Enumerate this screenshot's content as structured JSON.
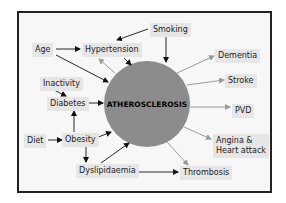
{
  "diagram": {
    "center": {
      "label": "ATHEROSCLEROSIS",
      "color": "#8c8c8c"
    },
    "frame_color": "#222222",
    "node_bg": "#e6e6e6",
    "arrow_colors": {
      "cause": "#111111",
      "effect": "#9a9a9a"
    },
    "nodes": {
      "smoking": "Smoking",
      "age": "Age",
      "hypertension": "Hypertension",
      "inactivity": "Inactivity",
      "diabetes": "Diabetes",
      "diet": "Diet",
      "obesity": "Obesity",
      "dyslipidaemia": "Dyslipidaemia",
      "dementia": "Dementia",
      "stroke": "Stroke",
      "pvd": "PVD",
      "angina_line1": "Angina &",
      "angina_line2": "Heart attack",
      "thrombosis": "Thrombosis"
    },
    "edges": [
      {
        "from": "Smoking",
        "to": "Hypertension",
        "type": "cause"
      },
      {
        "from": "Smoking",
        "to": "ATHEROSCLEROSIS",
        "type": "cause"
      },
      {
        "from": "Age",
        "to": "Hypertension",
        "type": "cause"
      },
      {
        "from": "Age",
        "to": "ATHEROSCLEROSIS",
        "type": "cause"
      },
      {
        "from": "Hypertension",
        "to": "ATHEROSCLEROSIS",
        "type": "cause"
      },
      {
        "from": "ATHEROSCLEROSIS",
        "to": "Hypertension",
        "type": "effect"
      },
      {
        "from": "Inactivity",
        "to": "Diabetes",
        "type": "cause"
      },
      {
        "from": "Diabetes",
        "to": "ATHEROSCLEROSIS",
        "type": "cause"
      },
      {
        "from": "Diet",
        "to": "Obesity",
        "type": "cause"
      },
      {
        "from": "Obesity",
        "to": "Diabetes",
        "type": "cause"
      },
      {
        "from": "Obesity",
        "to": "ATHEROSCLEROSIS",
        "type": "cause"
      },
      {
        "from": "Obesity",
        "to": "Dyslipidaemia",
        "type": "cause"
      },
      {
        "from": "Dyslipidaemia",
        "to": "ATHEROSCLEROSIS",
        "type": "cause"
      },
      {
        "from": "Dyslipidaemia",
        "to": "Thrombosis",
        "type": "cause"
      },
      {
        "from": "ATHEROSCLEROSIS",
        "to": "Dementia",
        "type": "effect"
      },
      {
        "from": "ATHEROSCLEROSIS",
        "to": "Stroke",
        "type": "effect"
      },
      {
        "from": "ATHEROSCLEROSIS",
        "to": "PVD",
        "type": "effect"
      },
      {
        "from": "ATHEROSCLEROSIS",
        "to": "Angina & Heart attack",
        "type": "effect"
      },
      {
        "from": "ATHEROSCLEROSIS",
        "to": "Thrombosis",
        "type": "effect"
      }
    ]
  }
}
